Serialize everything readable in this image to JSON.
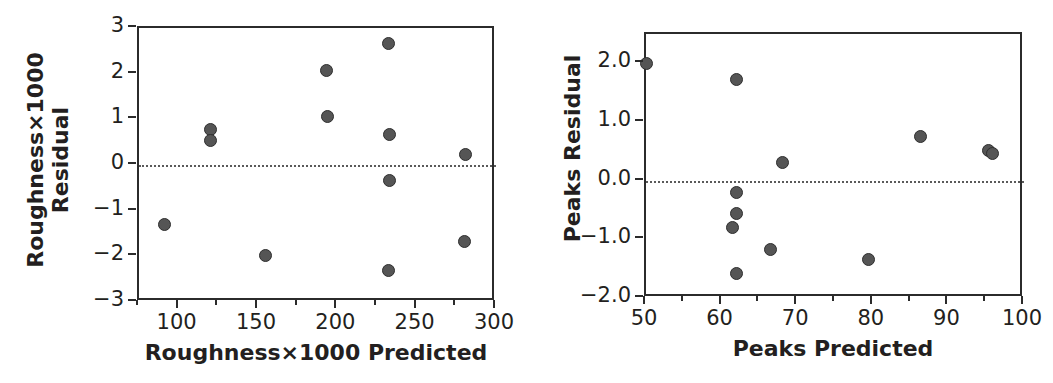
{
  "figure": {
    "background": "#ffffff",
    "marker_fill": "#555555",
    "marker_stroke": "#2e2e2e",
    "axis_color": "#2b2b2b",
    "zero_line_color": "#5a5a5a"
  },
  "chart_data": [
    {
      "type": "scatter",
      "title": "",
      "xlabel": "Roughness×1000 Predicted",
      "ylabel_line1": "Roughness×1000",
      "ylabel_line2": "Residual",
      "xlim": [
        75,
        300
      ],
      "ylim": [
        -3,
        3
      ],
      "grid": false,
      "legend": "none",
      "xticks": [
        100,
        150,
        200,
        250,
        300
      ],
      "xticklabels": [
        "100",
        "150",
        "200",
        "250",
        "300"
      ],
      "xminor": [
        75,
        125,
        175,
        225,
        275
      ],
      "yticks": [
        3,
        2,
        1,
        0,
        -1,
        -2,
        -3
      ],
      "yticklabels": [
        "3",
        "2",
        "1",
        "0",
        "−1",
        "−2",
        "−3"
      ],
      "reference_lines": [
        {
          "axis": "y",
          "value": 0,
          "style": "dotted"
        }
      ],
      "points": [
        {
          "x": 91,
          "y": -1.3
        },
        {
          "x": 120,
          "y": 0.78
        },
        {
          "x": 120,
          "y": 0.53
        },
        {
          "x": 155,
          "y": -1.98
        },
        {
          "x": 193,
          "y": 2.06
        },
        {
          "x": 194,
          "y": 1.07
        },
        {
          "x": 232,
          "y": 2.66
        },
        {
          "x": 233,
          "y": 0.67
        },
        {
          "x": 233,
          "y": -0.34
        },
        {
          "x": 232,
          "y": -2.32
        },
        {
          "x": 281,
          "y": 0.24
        },
        {
          "x": 280,
          "y": -1.67
        }
      ]
    },
    {
      "type": "scatter",
      "title": "",
      "xlabel": "Peaks Predicted",
      "ylabel_line1": "Peaks Residual",
      "ylabel_line2": "",
      "xlim": [
        50,
        100
      ],
      "ylim": [
        -2.0,
        2.5
      ],
      "grid": false,
      "legend": "none",
      "xticks": [
        50,
        60,
        70,
        80,
        90,
        100
      ],
      "xticklabels": [
        "50",
        "60",
        "70",
        "80",
        "90",
        "100"
      ],
      "xminor": [
        55,
        65,
        75,
        85,
        95
      ],
      "yticks": [
        2.0,
        1.0,
        0.0,
        -1.0,
        -2.0
      ],
      "yticklabels": [
        "2.0",
        "1.0",
        "0.0",
        "−1.0",
        "−2.0"
      ],
      "reference_lines": [
        {
          "axis": "y",
          "value": 0,
          "style": "dotted"
        }
      ],
      "points": [
        {
          "x": 50.0,
          "y": 2.0
        },
        {
          "x": 62.0,
          "y": 1.73
        },
        {
          "x": 68.0,
          "y": 0.31
        },
        {
          "x": 86.3,
          "y": 0.75
        },
        {
          "x": 95.3,
          "y": 0.51
        },
        {
          "x": 95.8,
          "y": 0.46
        },
        {
          "x": 62.0,
          "y": -0.2
        },
        {
          "x": 62.0,
          "y": -0.56
        },
        {
          "x": 61.4,
          "y": -0.79
        },
        {
          "x": 66.5,
          "y": -1.17
        },
        {
          "x": 79.4,
          "y": -1.35
        },
        {
          "x": 62.0,
          "y": -1.58
        }
      ]
    }
  ]
}
